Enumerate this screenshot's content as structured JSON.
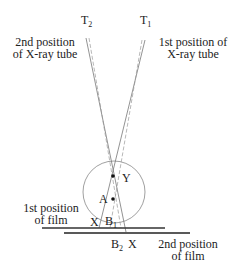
{
  "labels": {
    "t2": "T",
    "t2_sub": "2",
    "t1": "T",
    "t1_sub": "1",
    "tube2_line1": "2nd position",
    "tube2_line2": "of X-ray tube",
    "tube1_line1": "1st position of",
    "tube1_line2": "X-ray tube",
    "point_y": "Y",
    "point_a": "A",
    "x_left": "X",
    "b1": "B",
    "b1_sub": "1",
    "b2": "B",
    "b2_sub": "2",
    "x_right": "X",
    "film1_line1": "1st position",
    "film1_line2": "of film",
    "film2_line1": "2nd position",
    "film2_line2": "of film"
  },
  "colors": {
    "line": "#444444",
    "ray": "#888888",
    "film": "#222222"
  }
}
